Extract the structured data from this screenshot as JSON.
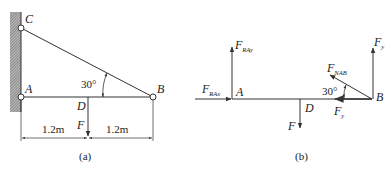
{
  "figure_a": {
    "caption": "(a)",
    "points": {
      "C": "C",
      "A": "A",
      "B": "B",
      "D": "D"
    },
    "angle_label": "30°",
    "force_label": "F",
    "dimensions": [
      "1.2m",
      "1.2m"
    ]
  },
  "figure_b": {
    "caption": "(b)",
    "points": {
      "A": "A",
      "B": "B",
      "D": "D"
    },
    "angle_label": "30°",
    "forces": {
      "FRAy": {
        "main": "F",
        "sub": "RAy"
      },
      "FRAx": {
        "main": "F",
        "sub": "RAx"
      },
      "F": {
        "main": "F"
      },
      "FNAB": {
        "main": "F",
        "sub": "NAB"
      },
      "Fy_vertical": {
        "main": "F",
        "sub": "y"
      },
      "Fy_horizontal": {
        "main": "F",
        "sub": "y"
      }
    }
  },
  "colors": {
    "line": "#333333",
    "hatch": "#555555",
    "text": "#222222"
  }
}
